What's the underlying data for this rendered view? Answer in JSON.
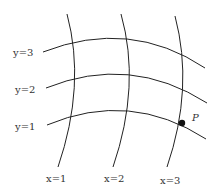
{
  "diagram": {
    "colors": {
      "line": "#222222",
      "text": "#333333",
      "point": "#111111",
      "background": "#ffffff"
    },
    "y_curves": [
      {
        "label": "y=3",
        "label_var": "y",
        "label_eq": "=3"
      },
      {
        "label": "y=2",
        "label_var": "y",
        "label_eq": "=2"
      },
      {
        "label": "y=1",
        "label_var": "y",
        "label_eq": "=1"
      }
    ],
    "x_curves": [
      {
        "label": "x=1",
        "label_var": "x",
        "label_eq": "=1"
      },
      {
        "label": "x=2",
        "label_var": "x",
        "label_eq": "=2"
      },
      {
        "label": "x=3",
        "label_var": "x",
        "label_eq": "=3"
      }
    ],
    "point": {
      "label": "P",
      "at": "intersection of x=3 and y=1"
    }
  }
}
